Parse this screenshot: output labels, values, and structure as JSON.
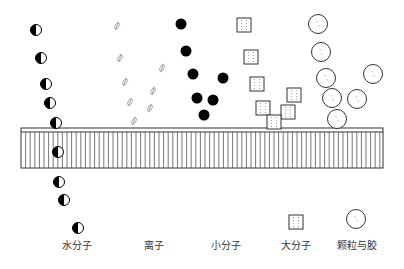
{
  "diagram": {
    "membrane": {
      "x": 21,
      "y": 128,
      "width": 362,
      "height": 40,
      "inner_line_offset": 4,
      "stripe_spacing": 4.6
    },
    "water_molecules": [
      [
        36,
        30
      ],
      [
        41,
        58
      ],
      [
        46,
        84
      ],
      [
        50,
        103
      ],
      [
        56,
        123
      ],
      [
        58,
        152
      ],
      [
        59,
        182
      ],
      [
        64,
        200
      ]
    ],
    "ions": [
      [
        117,
        26
      ],
      [
        120,
        58
      ],
      [
        125,
        82
      ],
      [
        130,
        102
      ],
      [
        134,
        121
      ],
      [
        162,
        68
      ],
      [
        153,
        91
      ],
      [
        150,
        108
      ]
    ],
    "small_molecules": [
      [
        181,
        24
      ],
      [
        186,
        51
      ],
      [
        193,
        74
      ],
      [
        223,
        78
      ],
      [
        197,
        98
      ],
      [
        213,
        100
      ],
      [
        204,
        115
      ]
    ],
    "large_molecules": [
      [
        244,
        25
      ],
      [
        251,
        57
      ],
      [
        257,
        84
      ],
      [
        294,
        95
      ],
      [
        263,
        108
      ],
      [
        288,
        112
      ],
      [
        274,
        122
      ]
    ],
    "particles": [
      [
        318,
        24
      ],
      [
        321,
        52
      ],
      [
        326,
        78
      ],
      [
        373,
        74
      ],
      [
        332,
        98
      ],
      [
        357,
        99
      ],
      [
        337,
        119
      ]
    ],
    "legend": [
      {
        "key": "water",
        "symbol": "water-molecule",
        "sx": 78,
        "sy": 228,
        "label": "水分子",
        "lx": 77,
        "ly": 237
      },
      {
        "key": "ion",
        "symbol": "ion",
        "label": "离子",
        "lx": 154,
        "ly": 237
      },
      {
        "key": "small",
        "symbol": "small-molecule",
        "label": "小分子",
        "lx": 226,
        "ly": 237
      },
      {
        "key": "large",
        "symbol": "large-molecule",
        "sx": 296,
        "sy": 222,
        "label": "大分子",
        "lx": 296,
        "ly": 237
      },
      {
        "key": "particle",
        "symbol": "particle-colloid",
        "sx": 356,
        "sy": 219,
        "label": "颗粒与胶",
        "lx": 357,
        "ly": 237
      }
    ]
  }
}
